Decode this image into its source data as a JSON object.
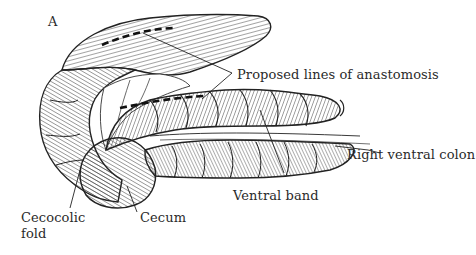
{
  "figure": {
    "panel_letter": "A",
    "labels": {
      "anastomosis": "Proposed lines of anastomosis",
      "right_ventral_colon": "Right ventral colon",
      "ventral_band": "Ventral band",
      "cecum": "Cecum",
      "cecocolic_fold_line1": "Cecocolic",
      "cecocolic_fold_line2": "fold"
    },
    "colors": {
      "ink": "#2a2a2a",
      "background": "#ffffff"
    }
  }
}
